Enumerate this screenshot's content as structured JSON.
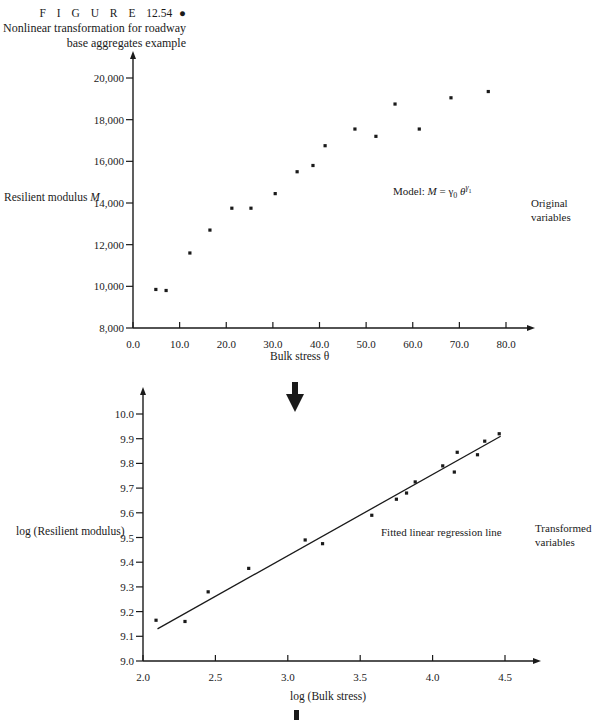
{
  "caption": {
    "figure_label": "F I G U R E",
    "figure_number": "12.54",
    "bullet": "●",
    "line1": "Nonlinear transformation for roadway",
    "line2": "base aggregates example"
  },
  "annotations": {
    "model_text": "Model: ",
    "model_M": "M",
    "model_eq": " = γ",
    "model_sub0": "0",
    "model_theta": " θ",
    "model_sup": "γ",
    "model_sup_sub": "1",
    "original_line1": "Original",
    "original_line2": "variables",
    "fitted_line": "Fitted linear regression line",
    "transformed_line1": "Transformed",
    "transformed_line2": "variables"
  },
  "chart_data": [
    {
      "type": "scatter",
      "title": "Original variables",
      "xlabel": "Bulk stress θ",
      "ylabel": "Resilient modulus M",
      "xlim": [
        0,
        80
      ],
      "ylim": [
        8000,
        20000
      ],
      "x_ticks": [
        "0.0",
        "10.0",
        "20.0",
        "30.0",
        "40.0",
        "50.0",
        "60.0",
        "70.0",
        "80.0"
      ],
      "y_ticks": [
        "8,000",
        "10,000",
        "12,000",
        "14,000",
        "16,000",
        "18,000",
        "20,000"
      ],
      "grid": false,
      "annotation": "Model: M = γ0 θ^γ1",
      "x": [
        4.9,
        7.1,
        12.2,
        16.5,
        21.2,
        25.3,
        30.5,
        35.2,
        38.6,
        41.2,
        47.6,
        52.1,
        56.2,
        61.4,
        68.2,
        76.2
      ],
      "y": [
        9850,
        9800,
        11600,
        12700,
        13750,
        13750,
        14450,
        15500,
        15800,
        16750,
        17550,
        17200,
        18750,
        17550,
        19050,
        19350
      ]
    },
    {
      "type": "scatter",
      "title": "Transformed variables",
      "xlabel": "log (Bulk stress)",
      "ylabel": "log (Resilient modulus)",
      "xlim": [
        2.0,
        4.5
      ],
      "ylim": [
        9.0,
        10.0
      ],
      "x_ticks": [
        "2.0",
        "2.5",
        "3.0",
        "3.5",
        "4.0",
        "4.5"
      ],
      "y_ticks": [
        "9.0",
        "9.1",
        "9.2",
        "9.3",
        "9.4",
        "9.5",
        "9.6",
        "9.7",
        "9.8",
        "9.9",
        "10.0"
      ],
      "grid": false,
      "annotation": "Fitted linear regression line",
      "x": [
        2.09,
        2.29,
        2.45,
        2.73,
        3.12,
        3.24,
        3.58,
        3.75,
        3.82,
        3.88,
        4.07,
        4.15,
        4.17,
        4.31,
        4.36,
        4.46
      ],
      "y": [
        9.165,
        9.16,
        9.28,
        9.375,
        9.49,
        9.475,
        9.59,
        9.655,
        9.68,
        9.725,
        9.79,
        9.765,
        9.845,
        9.835,
        9.89,
        9.92
      ],
      "fit_line": {
        "x": [
          2.1,
          4.47
        ],
        "y": [
          9.13,
          9.91
        ]
      }
    }
  ]
}
